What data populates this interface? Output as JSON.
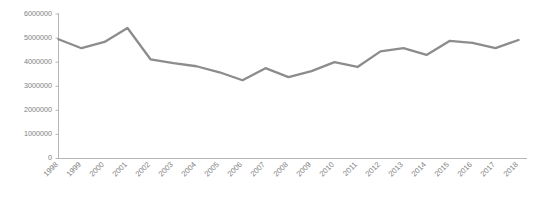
{
  "chart_data": {
    "type": "line",
    "title": "",
    "subtitle": "",
    "xlabel": "",
    "ylabel": "",
    "categories": [
      "1998",
      "1999",
      "2000",
      "2001",
      "2002",
      "2003",
      "2004",
      "2005",
      "2006",
      "2007",
      "2008",
      "2009",
      "2010",
      "2011",
      "2012",
      "2013",
      "2014",
      "2015",
      "2016",
      "2017",
      "2018"
    ],
    "values": [
      4950000,
      4580000,
      4840000,
      5420000,
      4120000,
      3960000,
      3830000,
      3580000,
      3250000,
      3750000,
      3380000,
      3630000,
      4000000,
      3800000,
      4450000,
      4580000,
      4300000,
      4880000,
      4800000,
      4580000,
      4920000
    ],
    "series": [
      {
        "name": "series-1",
        "values": [
          4950000,
          4580000,
          4840000,
          5420000,
          4120000,
          3960000,
          3830000,
          3580000,
          3250000,
          3750000,
          3380000,
          3630000,
          4000000,
          3800000,
          4450000,
          4580000,
          4300000,
          4880000,
          4800000,
          4580000,
          4920000
        ],
        "color": "#8c8c8c"
      }
    ],
    "ylim": [
      0,
      6000000
    ],
    "ytick_values": [
      0,
      1000000,
      2000000,
      3000000,
      4000000,
      5000000,
      6000000
    ],
    "ytick_labels": [
      "0",
      "1000000",
      "2000000",
      "3000000",
      "4000000",
      "5000000",
      "6000000"
    ],
    "grid": false,
    "legend": "none",
    "annotations": []
  },
  "axes": {
    "y_axis_color": "#adadad",
    "x_axis_color": "#adadad",
    "tick_label_color": "#808080",
    "xtick_rotation": -45
  },
  "plot": {
    "background": "#ffffff",
    "line_color": "#8c8c8c"
  }
}
